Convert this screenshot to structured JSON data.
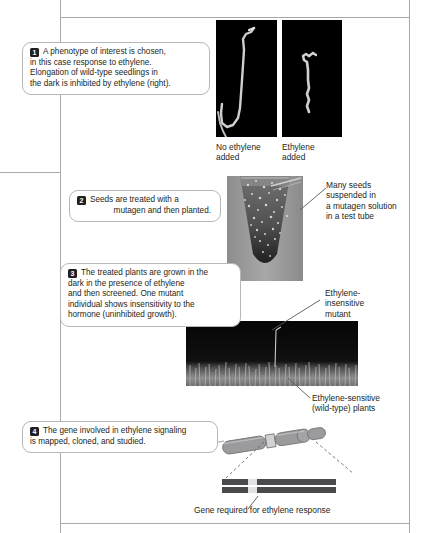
{
  "figure": {
    "title_fragment": "",
    "steps": [
      {
        "number": "1",
        "lines": [
          "A phenotype of interest is chosen,",
          "in this case response to ethylene.",
          "Elongation of wild-type seedlings in",
          "the dark is inhibited by ethylene (right)."
        ]
      },
      {
        "number": "2",
        "lines": [
          "Seeds are treated with a",
          "mutagen and then planted."
        ]
      },
      {
        "number": "3",
        "lines": [
          "The treated plants are grown in the",
          "dark in the presence of ethylene",
          "and then screened. One mutant",
          "individual shows insensitivity to the",
          "hormone (uninhibited growth)."
        ]
      },
      {
        "number": "4",
        "lines": [
          "The gene involved in ethylene signaling",
          "is mapped, cloned, and studied."
        ]
      }
    ],
    "labels": {
      "no_ethylene": [
        "No ethylene",
        "added"
      ],
      "ethylene_added": [
        "Ethylene",
        "added"
      ],
      "test_tube": [
        "Many seeds",
        "suspended in",
        "a mutagen solution",
        "in a test tube"
      ],
      "mutant": [
        "Ethylene-",
        "insensitive",
        "mutant"
      ],
      "wild_type": [
        "Ethylene-sensitive",
        "(wild-type) plants"
      ],
      "gene": "Gene required for ethylene response"
    },
    "panels": {
      "seedling_no_ethylene_alt": "dark-field photo of an elongated etiolated seedling",
      "seedling_ethylene_alt": "dark-field photo of a short stunted seedling",
      "test_tube_alt": "photo of a test tube containing seeds suspended in mutagen solution",
      "field_alt": "photo of a dark tray of short seedlings with one tall mutant"
    },
    "colors": {
      "text": "#231f20",
      "rule": "#a9a9ab",
      "callout_border": "#b6b7b9",
      "photo_bg": "#000000",
      "chromosome_fill": "#9b9b9d",
      "chromosome_stroke": "#6e6e70",
      "band_dark": "#3a3a3c",
      "band_light": "#d8d8da"
    }
  }
}
